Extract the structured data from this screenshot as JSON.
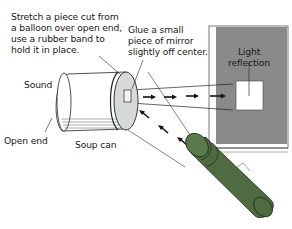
{
  "diagram": {
    "labels": {
      "balloon_instruction": "Stretch a piece cut from\na balloon over open end,\nuse a rubber band to\nhold it in place.",
      "mirror_instruction": "Glue a small\npiece of mirror\nslightly off center.",
      "light_reflection": "Light\nreflection",
      "sound": "Sound",
      "open_end": "Open end",
      "soup_can": "Soup can"
    },
    "components": [
      "soup-can",
      "balloon-membrane",
      "mirror",
      "flashlight",
      "screen"
    ],
    "colors": {
      "flashlight": "#4e6b41",
      "flashlight_dark": "#33472b",
      "screen_gray": "#8a8a8a",
      "reflection_spot": "#ffffff",
      "can_lid": "#d6dad6",
      "line": "#222222"
    }
  }
}
